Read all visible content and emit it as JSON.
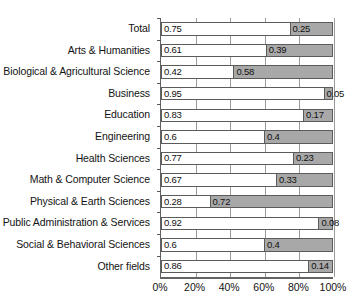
{
  "chart_data": {
    "type": "bar",
    "orientation": "horizontal",
    "stacked": true,
    "title": "",
    "xlabel": "",
    "ylabel": "",
    "xlim": [
      0,
      1
    ],
    "grid": true,
    "legend_position": "none",
    "xtick_labels": [
      "0%",
      "20%",
      "40%",
      "60%",
      "80%",
      "100%"
    ],
    "xtick_values": [
      0,
      0.2,
      0.4,
      0.6,
      0.8,
      1.0
    ],
    "categories": [
      "Total",
      "Arts & Humanities",
      "Biological & Agricultural Science",
      "Business",
      "Education",
      "Engineering",
      "Health Sciences",
      "Math & Computer Science",
      "Physical & Earth Sciences",
      "Public Administration & Services",
      "Social & Behavioral Sciences",
      "Other fields"
    ],
    "series": [
      {
        "name": "segment-1",
        "color": "#ffffff",
        "values": [
          0.75,
          0.61,
          0.42,
          0.95,
          0.83,
          0.6,
          0.77,
          0.67,
          0.28,
          0.92,
          0.6,
          0.86
        ],
        "labels": [
          "0.75",
          "0.61",
          "0.42",
          "0.95",
          "0.83",
          "0.6",
          "0.77",
          "0.67",
          "0.28",
          "0.92",
          "0.6",
          "0.86"
        ]
      },
      {
        "name": "segment-2",
        "color": "#a8a8a8",
        "values": [
          0.25,
          0.39,
          0.58,
          0.05,
          0.17,
          0.4,
          0.23,
          0.33,
          0.72,
          0.08,
          0.4,
          0.14
        ],
        "labels": [
          "0.25",
          "0.39",
          "0.58",
          "0.05",
          "0.17",
          "0.4",
          "0.23",
          "0.33",
          "0.72",
          "0.08",
          "0.4",
          "0.14"
        ]
      }
    ]
  }
}
